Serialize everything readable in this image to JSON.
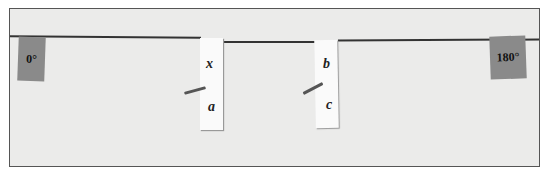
{
  "figure": {
    "left_tag": "0°",
    "right_tag": "180°",
    "strip1": {
      "top_label": "x",
      "bottom_label": "a"
    },
    "strip2": {
      "top_label": "b",
      "bottom_label": "c"
    }
  }
}
